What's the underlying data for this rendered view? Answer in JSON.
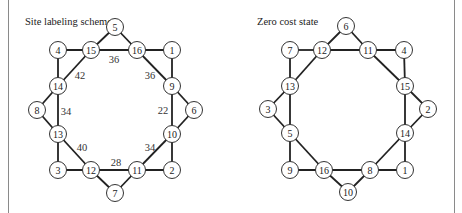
{
  "panels": [
    {
      "id": "left",
      "title": "Site labeling scheme",
      "title_pos": [
        25,
        25
      ],
      "nodes": [
        {
          "label": "5",
          "x": 115,
          "y": 27
        },
        {
          "label": "4",
          "x": 58,
          "y": 50
        },
        {
          "label": "15",
          "x": 91,
          "y": 50
        },
        {
          "label": "16",
          "x": 137,
          "y": 50
        },
        {
          "label": "1",
          "x": 172,
          "y": 50
        },
        {
          "label": "14",
          "x": 58,
          "y": 86
        },
        {
          "label": "9",
          "x": 172,
          "y": 86
        },
        {
          "label": "8",
          "x": 37,
          "y": 110
        },
        {
          "label": "6",
          "x": 194,
          "y": 110
        },
        {
          "label": "13",
          "x": 58,
          "y": 134
        },
        {
          "label": "10",
          "x": 172,
          "y": 134
        },
        {
          "label": "3",
          "x": 58,
          "y": 170
        },
        {
          "label": "12",
          "x": 91,
          "y": 170
        },
        {
          "label": "11",
          "x": 137,
          "y": 170
        },
        {
          "label": "2",
          "x": 172,
          "y": 170
        },
        {
          "label": "7",
          "x": 115,
          "y": 193
        }
      ],
      "edges": [
        [
          "4",
          "15"
        ],
        [
          "15",
          "16"
        ],
        [
          "16",
          "1"
        ],
        [
          "15",
          "5"
        ],
        [
          "5",
          "16"
        ],
        [
          "4",
          "14"
        ],
        [
          "15",
          "14"
        ],
        [
          "16",
          "9"
        ],
        [
          "1",
          "9"
        ],
        [
          "14",
          "8"
        ],
        [
          "8",
          "13"
        ],
        [
          "14",
          "13"
        ],
        [
          "9",
          "6"
        ],
        [
          "6",
          "10"
        ],
        [
          "9",
          "10"
        ],
        [
          "13",
          "3"
        ],
        [
          "13",
          "12"
        ],
        [
          "10",
          "11"
        ],
        [
          "10",
          "2"
        ],
        [
          "3",
          "12"
        ],
        [
          "12",
          "11"
        ],
        [
          "11",
          "2"
        ],
        [
          "12",
          "7"
        ],
        [
          "7",
          "11"
        ]
      ],
      "weights": [
        {
          "text": "36",
          "x": 114,
          "y": 59
        },
        {
          "text": "42",
          "x": 80,
          "y": 75
        },
        {
          "text": "36",
          "x": 150,
          "y": 75
        },
        {
          "text": "34",
          "x": 66,
          "y": 111
        },
        {
          "text": "22",
          "x": 163,
          "y": 110
        },
        {
          "text": "40",
          "x": 82,
          "y": 147
        },
        {
          "text": "34",
          "x": 150,
          "y": 147
        },
        {
          "text": "28",
          "x": 116,
          "y": 162
        }
      ]
    },
    {
      "id": "right",
      "title": "Zero cost state",
      "title_pos": [
        257,
        25
      ],
      "nodes": [
        {
          "label": "6",
          "x": 346,
          "y": 26
        },
        {
          "label": "7",
          "x": 290,
          "y": 50
        },
        {
          "label": "12",
          "x": 322,
          "y": 50
        },
        {
          "label": "11",
          "x": 368,
          "y": 50
        },
        {
          "label": "4",
          "x": 404,
          "y": 50
        },
        {
          "label": "13",
          "x": 290,
          "y": 86
        },
        {
          "label": "15",
          "x": 405,
          "y": 86
        },
        {
          "label": "3",
          "x": 268,
          "y": 109
        },
        {
          "label": "2",
          "x": 428,
          "y": 109
        },
        {
          "label": "5",
          "x": 290,
          "y": 133
        },
        {
          "label": "14",
          "x": 405,
          "y": 133
        },
        {
          "label": "9",
          "x": 290,
          "y": 170
        },
        {
          "label": "16",
          "x": 324,
          "y": 170
        },
        {
          "label": "8",
          "x": 370,
          "y": 170
        },
        {
          "label": "1",
          "x": 405,
          "y": 170
        },
        {
          "label": "10",
          "x": 348,
          "y": 192
        }
      ],
      "edges": [
        [
          "7",
          "12"
        ],
        [
          "12",
          "11"
        ],
        [
          "11",
          "4"
        ],
        [
          "12",
          "6"
        ],
        [
          "6",
          "11"
        ],
        [
          "7",
          "13"
        ],
        [
          "12",
          "13"
        ],
        [
          "11",
          "15"
        ],
        [
          "4",
          "15"
        ],
        [
          "13",
          "3"
        ],
        [
          "3",
          "5"
        ],
        [
          "13",
          "5"
        ],
        [
          "15",
          "2"
        ],
        [
          "2",
          "14"
        ],
        [
          "15",
          "14"
        ],
        [
          "5",
          "9"
        ],
        [
          "5",
          "16"
        ],
        [
          "14",
          "8"
        ],
        [
          "14",
          "1"
        ],
        [
          "9",
          "16"
        ],
        [
          "16",
          "8"
        ],
        [
          "8",
          "1"
        ],
        [
          "16",
          "10"
        ],
        [
          "10",
          "8"
        ]
      ],
      "weights": []
    }
  ],
  "frame": {
    "left_x": 8,
    "right_x": 454
  },
  "style": {
    "node_radius": 8.5,
    "edge_color": "#222222",
    "line_color": "#8a8a8a"
  }
}
